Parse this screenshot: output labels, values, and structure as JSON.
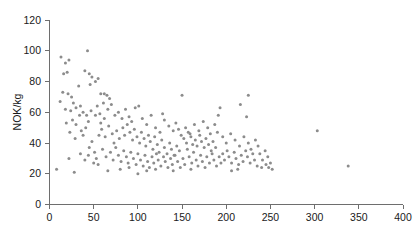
{
  "chart_data": {
    "type": "scatter",
    "title": "",
    "subtitle": "",
    "xlabel": "",
    "ylabel": "NOK/kg",
    "xlim": [
      0,
      400
    ],
    "ylim": [
      0,
      120
    ],
    "xticks": [
      0,
      50,
      100,
      150,
      200,
      250,
      300,
      350,
      400
    ],
    "yticks": [
      0,
      20,
      40,
      60,
      80,
      100,
      120
    ],
    "grid": false,
    "legend": null,
    "legend_position": "none",
    "marker": {
      "shape": "circle",
      "color": "#8c8c8c",
      "size_px": 3
    },
    "series": [
      {
        "name": "observations",
        "points": [
          [
            13,
            96
          ],
          [
            18,
            92
          ],
          [
            22,
            94
          ],
          [
            16,
            85
          ],
          [
            20,
            86
          ],
          [
            43,
            100
          ],
          [
            45,
            85
          ],
          [
            48,
            83
          ],
          [
            55,
            82
          ],
          [
            40,
            87
          ],
          [
            15,
            73
          ],
          [
            21,
            72
          ],
          [
            25,
            70
          ],
          [
            33,
            77
          ],
          [
            46,
            78
          ],
          [
            52,
            80
          ],
          [
            58,
            72
          ],
          [
            12,
            67
          ],
          [
            27,
            66
          ],
          [
            35,
            64
          ],
          [
            62,
            72
          ],
          [
            65,
            71
          ],
          [
            68,
            69
          ],
          [
            150,
            71
          ],
          [
            128,
            59
          ],
          [
            97,
            63
          ],
          [
            101,
            64
          ],
          [
            18,
            62
          ],
          [
            24,
            61
          ],
          [
            30,
            63
          ],
          [
            38,
            60
          ],
          [
            42,
            58
          ],
          [
            47,
            61
          ],
          [
            54,
            64
          ],
          [
            57,
            59
          ],
          [
            61,
            66
          ],
          [
            66,
            62
          ],
          [
            70,
            65
          ],
          [
            74,
            58
          ],
          [
            78,
            60
          ],
          [
            82,
            56
          ],
          [
            86,
            62
          ],
          [
            90,
            57
          ],
          [
            93,
            54
          ],
          [
            105,
            56
          ],
          [
            110,
            52
          ],
          [
            115,
            58
          ],
          [
            120,
            50
          ],
          [
            125,
            47
          ],
          [
            8,
            23
          ],
          [
            22,
            30
          ],
          [
            28,
            21
          ],
          [
            35,
            33
          ],
          [
            40,
            29
          ],
          [
            44,
            32
          ],
          [
            50,
            27
          ],
          [
            53,
            30
          ],
          [
            56,
            45
          ],
          [
            59,
            49
          ],
          [
            63,
            44
          ],
          [
            67,
            51
          ],
          [
            71,
            46
          ],
          [
            73,
            40
          ],
          [
            76,
            48
          ],
          [
            79,
            43
          ],
          [
            83,
            50
          ],
          [
            85,
            45
          ],
          [
            88,
            52
          ],
          [
            91,
            47
          ],
          [
            94,
            42
          ],
          [
            96,
            49
          ],
          [
            99,
            44
          ],
          [
            102,
            40
          ],
          [
            104,
            47
          ],
          [
            107,
            43
          ],
          [
            109,
            38
          ],
          [
            112,
            45
          ],
          [
            114,
            41
          ],
          [
            117,
            36
          ],
          [
            119,
            44
          ],
          [
            122,
            39
          ],
          [
            124,
            34
          ],
          [
            127,
            42
          ],
          [
            130,
            37
          ],
          [
            133,
            33
          ],
          [
            136,
            40
          ],
          [
            138,
            36
          ],
          [
            141,
            32
          ],
          [
            144,
            38
          ],
          [
            147,
            35
          ],
          [
            60,
            36
          ],
          [
            64,
            31
          ],
          [
            69,
            34
          ],
          [
            72,
            29
          ],
          [
            75,
            37
          ],
          [
            78,
            32
          ],
          [
            81,
            28
          ],
          [
            84,
            35
          ],
          [
            87,
            31
          ],
          [
            89,
            27
          ],
          [
            92,
            34
          ],
          [
            95,
            30
          ],
          [
            98,
            26
          ],
          [
            100,
            33
          ],
          [
            103,
            29
          ],
          [
            106,
            25
          ],
          [
            108,
            32
          ],
          [
            111,
            28
          ],
          [
            113,
            24
          ],
          [
            116,
            31
          ],
          [
            118,
            27
          ],
          [
            121,
            33
          ],
          [
            123,
            29
          ],
          [
            126,
            25
          ],
          [
            129,
            31
          ],
          [
            131,
            28
          ],
          [
            134,
            24
          ],
          [
            137,
            30
          ],
          [
            139,
            26
          ],
          [
            142,
            32
          ],
          [
            145,
            28
          ],
          [
            148,
            24
          ],
          [
            151,
            30
          ],
          [
            153,
            26
          ],
          [
            156,
            36
          ],
          [
            158,
            31
          ],
          [
            161,
            27
          ],
          [
            163,
            34
          ],
          [
            166,
            29
          ],
          [
            168,
            25
          ],
          [
            171,
            32
          ],
          [
            173,
            28
          ],
          [
            176,
            24
          ],
          [
            178,
            31
          ],
          [
            181,
            27
          ],
          [
            184,
            33
          ],
          [
            186,
            29
          ],
          [
            189,
            25
          ],
          [
            192,
            31
          ],
          [
            194,
            27
          ],
          [
            152,
            43
          ],
          [
            155,
            40
          ],
          [
            157,
            47
          ],
          [
            160,
            44
          ],
          [
            162,
            39
          ],
          [
            165,
            42
          ],
          [
            167,
            38
          ],
          [
            170,
            45
          ],
          [
            172,
            41
          ],
          [
            175,
            37
          ],
          [
            177,
            43
          ],
          [
            180,
            39
          ],
          [
            183,
            35
          ],
          [
            185,
            41
          ],
          [
            188,
            37
          ],
          [
            130,
            55
          ],
          [
            135,
            51
          ],
          [
            140,
            48
          ],
          [
            143,
            53
          ],
          [
            146,
            49
          ],
          [
            149,
            45
          ],
          [
            154,
            50
          ],
          [
            159,
            46
          ],
          [
            164,
            52
          ],
          [
            169,
            48
          ],
          [
            174,
            54
          ],
          [
            179,
            50
          ],
          [
            182,
            46
          ],
          [
            187,
            52
          ],
          [
            190,
            47
          ],
          [
            196,
            33
          ],
          [
            198,
            29
          ],
          [
            201,
            35
          ],
          [
            203,
            31
          ],
          [
            206,
            27
          ],
          [
            209,
            34
          ],
          [
            211,
            30
          ],
          [
            214,
            26
          ],
          [
            217,
            32
          ],
          [
            219,
            28
          ],
          [
            222,
            35
          ],
          [
            224,
            31
          ],
          [
            227,
            27
          ],
          [
            230,
            33
          ],
          [
            232,
            29
          ],
          [
            196,
            44
          ],
          [
            200,
            40
          ],
          [
            205,
            46
          ],
          [
            210,
            42
          ],
          [
            215,
            38
          ],
          [
            220,
            44
          ],
          [
            225,
            40
          ],
          [
            228,
            36
          ],
          [
            233,
            42
          ],
          [
            236,
            38
          ],
          [
            191,
            58
          ],
          [
            216,
            65
          ],
          [
            223,
            57
          ],
          [
            238,
            33
          ],
          [
            241,
            29
          ],
          [
            244,
            35
          ],
          [
            247,
            31
          ],
          [
            250,
            27
          ],
          [
            252,
            23
          ],
          [
            235,
            25
          ],
          [
            240,
            24
          ],
          [
            245,
            26
          ],
          [
            248,
            24
          ],
          [
            206,
            22
          ],
          [
            213,
            23
          ],
          [
            66,
            22
          ],
          [
            80,
            23
          ],
          [
            90,
            24
          ],
          [
            110,
            22
          ],
          [
            120,
            23
          ],
          [
            140,
            22
          ],
          [
            160,
            23
          ],
          [
            100,
            20
          ],
          [
            55,
            26
          ],
          [
            45,
            37
          ],
          [
            48,
            41
          ],
          [
            51,
            34
          ],
          [
            38,
            45
          ],
          [
            30,
            52
          ],
          [
            26,
            55
          ],
          [
            34,
            58
          ],
          [
            41,
            50
          ],
          [
            44,
            54
          ],
          [
            36,
            48
          ],
          [
            29,
            43
          ],
          [
            23,
            47
          ],
          [
            19,
            53
          ],
          [
            58,
            53
          ],
          [
            62,
            56
          ],
          [
            52,
            58
          ],
          [
            303,
            48
          ],
          [
            338,
            25
          ],
          [
            225,
            71
          ],
          [
            193,
            63
          ]
        ]
      }
    ]
  },
  "axes": {
    "y_title": "NOK/kg",
    "x_tick_labels": [
      "0",
      "50",
      "100",
      "150",
      "200",
      "250",
      "300",
      "350",
      "400"
    ],
    "y_tick_labels": [
      "0",
      "20",
      "40",
      "60",
      "80",
      "100",
      "120"
    ]
  },
  "colors": {
    "marker": "#8c8c8c",
    "axis": "#6e6e6e",
    "text": "#1a1a1a",
    "background": "#ffffff"
  }
}
